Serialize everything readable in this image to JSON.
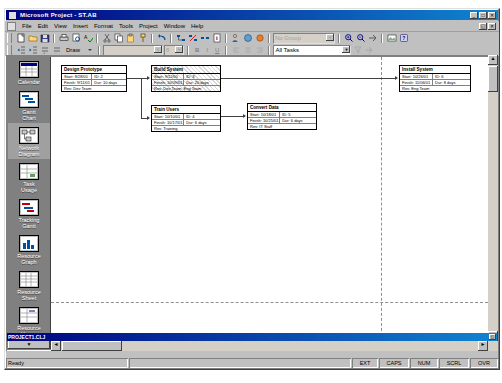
{
  "window": {
    "title": "Microsoft Project - ST.AB",
    "icon": "project-icon",
    "minimize": "_",
    "maximize": "□",
    "close": "✕"
  },
  "document": {
    "title": "PROJECT1.CLJ",
    "restore": "◱"
  },
  "menu": {
    "items": [
      {
        "label": "File"
      },
      {
        "label": "Edit"
      },
      {
        "label": "View"
      },
      {
        "label": "Insert"
      },
      {
        "label": "Format"
      },
      {
        "label": "Tools"
      },
      {
        "label": "Project"
      },
      {
        "label": "Window"
      },
      {
        "label": "Help"
      }
    ],
    "mdi_restore": "◱",
    "mdi_close": "✕"
  },
  "toolbar_standard": {
    "buttons": [
      {
        "name": "new-icon"
      },
      {
        "name": "open-icon"
      },
      {
        "name": "save-icon"
      },
      {
        "name": "print-icon"
      },
      {
        "name": "print-preview-icon"
      },
      {
        "name": "spelling-icon"
      },
      {
        "name": "cut-icon"
      },
      {
        "name": "copy-icon"
      },
      {
        "name": "paste-icon"
      },
      {
        "name": "format-painter-icon"
      },
      {
        "name": "undo-icon"
      },
      {
        "name": "link-tasks-icon"
      },
      {
        "name": "unlink-tasks-icon"
      },
      {
        "name": "split-task-icon"
      },
      {
        "name": "task-information-icon"
      },
      {
        "name": "assign-resources-icon"
      },
      {
        "name": "publish-icon"
      },
      {
        "name": "insert-hyperlink-icon"
      },
      {
        "name": "web-toolbar-icon"
      }
    ],
    "zoom_combo_value": "No Group",
    "zoom_buttons": [
      {
        "name": "zoom-in-icon"
      },
      {
        "name": "zoom-out-icon"
      },
      {
        "name": "goto-selected-task-icon"
      },
      {
        "name": "copy-picture-icon"
      },
      {
        "name": "office-assistant-icon"
      }
    ]
  },
  "toolbar_formatting": {
    "outline_buttons": [
      {
        "name": "outdent-icon"
      },
      {
        "name": "indent-icon"
      },
      {
        "name": "show-subtasks-icon"
      },
      {
        "name": "hide-subtasks-icon"
      }
    ],
    "draw_label": "Draw",
    "font_name": "",
    "font_size": "8",
    "style_buttons": [
      {
        "name": "bold-icon",
        "label": "B"
      },
      {
        "name": "italic-icon",
        "label": "I"
      },
      {
        "name": "underline-icon",
        "label": "U"
      }
    ],
    "align_buttons": [
      {
        "name": "align-left-icon"
      },
      {
        "name": "align-center-icon"
      },
      {
        "name": "align-right-icon"
      }
    ],
    "filter_value": "All Tasks",
    "filter_buttons": [
      {
        "name": "autofilter-icon"
      },
      {
        "name": "goto-task-icon"
      }
    ]
  },
  "viewbar": {
    "items": [
      {
        "label": "Calendar",
        "icon": "calendar-view-icon",
        "active": false
      },
      {
        "label": "Gantt\nChart",
        "icon": "gantt-chart-view-icon",
        "active": false
      },
      {
        "label": "Network\nDiagram",
        "icon": "network-diagram-view-icon",
        "active": true
      },
      {
        "label": "Task\nUsage",
        "icon": "task-usage-view-icon",
        "active": false
      },
      {
        "label": "Tracking\nGantt",
        "icon": "tracking-gantt-view-icon",
        "active": false
      },
      {
        "label": "Resource\nGraph",
        "icon": "resource-graph-view-icon",
        "active": false
      },
      {
        "label": "Resource\nSheet",
        "icon": "resource-sheet-view-icon",
        "active": false
      },
      {
        "label": "Resource\nUsage",
        "icon": "resource-usage-view-icon",
        "active": false
      }
    ],
    "scroll_down": "▼"
  },
  "diagram": {
    "nodes": [
      {
        "title": "Design Prototype",
        "hatched": false,
        "left": 10,
        "top": 8,
        "width": 66,
        "height": 27,
        "rows": [
          [
            "Start: 8/28/01",
            "ID: 2"
          ],
          [
            "Finish: 9/11/01",
            "Dur: 10 days"
          ],
          [
            "Res: Dev Team",
            ""
          ]
        ]
      },
      {
        "title": "Build System",
        "hatched": true,
        "left": 100,
        "top": 8,
        "width": 70,
        "height": 27,
        "rows": [
          [
            "Start: 9/12/01",
            "ID: 3"
          ],
          [
            "Finish: 10/09/01",
            "Dur: 20 days"
          ],
          [
            "Res: Dev Team, Eng Team",
            ""
          ]
        ]
      },
      {
        "title": "Train Users",
        "hatched": false,
        "left": 100,
        "top": 48,
        "width": 70,
        "height": 27,
        "rows": [
          [
            "Start: 10/10/01",
            "ID: 4"
          ],
          [
            "Finish: 10/17/01",
            "Dur: 6 days"
          ],
          [
            "Res: Training",
            ""
          ]
        ]
      },
      {
        "title": "Convert Data",
        "hatched": false,
        "left": 196,
        "top": 46,
        "width": 70,
        "height": 27,
        "rows": [
          [
            "Start: 10/18/01",
            "ID: 5"
          ],
          [
            "Finish: 10/25/01",
            "Dur: 6 days"
          ],
          [
            "Res: IT Staff",
            ""
          ]
        ]
      },
      {
        "title": "Install System",
        "hatched": false,
        "left": 348,
        "top": 8,
        "width": 72,
        "height": 27,
        "rows": [
          [
            "Start: 10/26/01",
            "ID: 6"
          ],
          [
            "Finish: 11/06/01",
            "Dur: 8 days"
          ],
          [
            "Res: Eng Team",
            ""
          ]
        ]
      }
    ]
  },
  "statusbar": {
    "ready": "Ready",
    "extend": "EXT",
    "caps": "CAPS",
    "num": "NUM",
    "scroll": "SCRL",
    "overtype": "OVR"
  }
}
